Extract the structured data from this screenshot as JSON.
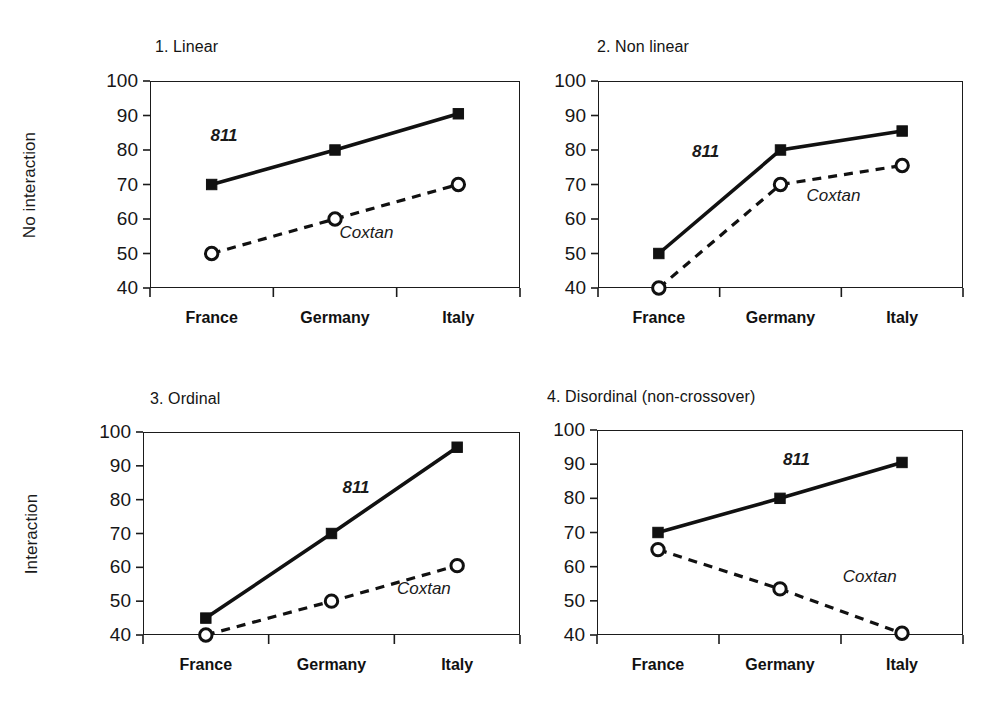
{
  "figure": {
    "row_labels": [
      "No interaction",
      "Interaction"
    ],
    "categories": [
      "France",
      "Germany",
      "Italy"
    ],
    "y_ticks": [
      "40",
      "50",
      "60",
      "70",
      "80",
      "90",
      "100"
    ],
    "series_names": [
      "811",
      "Coxtan"
    ],
    "colors": {
      "line": "#111111",
      "background": "#ffffff",
      "axis": "#1b1b1b",
      "marker_fill_811": "#111111",
      "marker_fill_coxtan": "#ffffff"
    }
  },
  "panels": [
    {
      "title": "1. Linear",
      "label_811": "811",
      "label_coxtan": "Coxtan"
    },
    {
      "title": "2. Non linear",
      "label_811": "811",
      "label_coxtan": "Coxtan"
    },
    {
      "title": "3. Ordinal",
      "label_811": "811",
      "label_coxtan": "Coxtan"
    },
    {
      "title": "4. Disordinal (non-crossover)",
      "label_811": "811",
      "label_coxtan": "Coxtan"
    }
  ],
  "chart_data": [
    {
      "type": "line",
      "title": "1. Linear",
      "xlabel": "",
      "ylabel": "No interaction",
      "categories": [
        "France",
        "Germany",
        "Italy"
      ],
      "ylim": [
        40,
        100
      ],
      "yticks": [
        40,
        50,
        60,
        70,
        80,
        90,
        100
      ],
      "grid": false,
      "legend": "inline-annotation",
      "series": [
        {
          "name": "811",
          "values": [
            70,
            80,
            90.5
          ],
          "style": "solid",
          "marker": "filled-square"
        },
        {
          "name": "Coxtan",
          "values": [
            50,
            60,
            70
          ],
          "style": "dashed",
          "marker": "open-circle"
        }
      ]
    },
    {
      "type": "line",
      "title": "2. Non linear",
      "xlabel": "",
      "ylabel": "No interaction",
      "categories": [
        "France",
        "Germany",
        "Italy"
      ],
      "ylim": [
        40,
        100
      ],
      "yticks": [
        40,
        50,
        60,
        70,
        80,
        90,
        100
      ],
      "grid": false,
      "legend": "inline-annotation",
      "series": [
        {
          "name": "811",
          "values": [
            50,
            80,
            85.5
          ],
          "style": "solid",
          "marker": "filled-square"
        },
        {
          "name": "Coxtan",
          "values": [
            40,
            70,
            75.5
          ],
          "style": "dashed",
          "marker": "open-circle"
        }
      ]
    },
    {
      "type": "line",
      "title": "3. Ordinal",
      "xlabel": "",
      "ylabel": "Interaction",
      "categories": [
        "France",
        "Germany",
        "Italy"
      ],
      "ylim": [
        40,
        100
      ],
      "yticks": [
        40,
        50,
        60,
        70,
        80,
        90,
        100
      ],
      "grid": false,
      "legend": "inline-annotation",
      "series": [
        {
          "name": "811",
          "values": [
            45,
            70,
            95.5
          ],
          "style": "solid",
          "marker": "filled-square"
        },
        {
          "name": "Coxtan",
          "values": [
            40,
            50,
            60.5
          ],
          "style": "dashed",
          "marker": "open-circle"
        }
      ]
    },
    {
      "type": "line",
      "title": "4. Disordinal (non-crossover)",
      "xlabel": "",
      "ylabel": "Interaction",
      "categories": [
        "France",
        "Germany",
        "Italy"
      ],
      "ylim": [
        40,
        100
      ],
      "yticks": [
        40,
        50,
        60,
        70,
        80,
        90,
        100
      ],
      "grid": false,
      "legend": "inline-annotation",
      "series": [
        {
          "name": "811",
          "values": [
            70,
            80,
            90.5
          ],
          "style": "solid",
          "marker": "filled-square"
        },
        {
          "name": "Coxtan",
          "values": [
            65,
            53.5,
            40.5
          ],
          "style": "dashed",
          "marker": "open-circle"
        }
      ]
    }
  ]
}
